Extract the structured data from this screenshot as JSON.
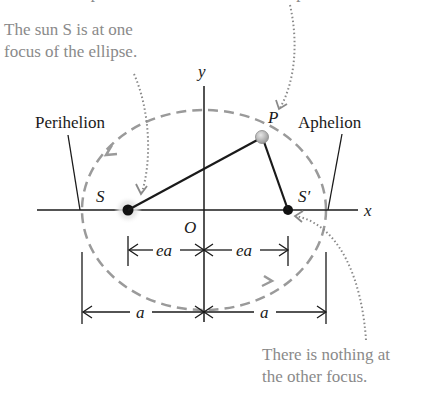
{
  "title_partial": "The planet P moves around the elliptical orbit.",
  "notes": {
    "sun_focus_line1": "The sun S is at one",
    "sun_focus_line2": "focus of the ellipse.",
    "other_focus_line1": "There is nothing at",
    "other_focus_line2": "the other focus."
  },
  "labels": {
    "perihelion": "Perihelion",
    "aphelion": "Aphelion",
    "planet": "P",
    "sun": "S",
    "other_focus": "S′",
    "origin": "O",
    "x_axis": "x",
    "y_axis": "y",
    "ea_left": "ea",
    "ea_right": "ea",
    "a_left": "a",
    "a_right": "a"
  },
  "geometry": {
    "center": [
      204,
      210
    ],
    "semi_major_axis_px": 122,
    "semi_minor_axis_px": 100,
    "focus_offset_px": 80
  },
  "colors": {
    "ink": "#1a1a1a",
    "orbit": "#9a9a9a",
    "note": "#8a8a8a",
    "planet_fill": "#b0b0b0"
  }
}
